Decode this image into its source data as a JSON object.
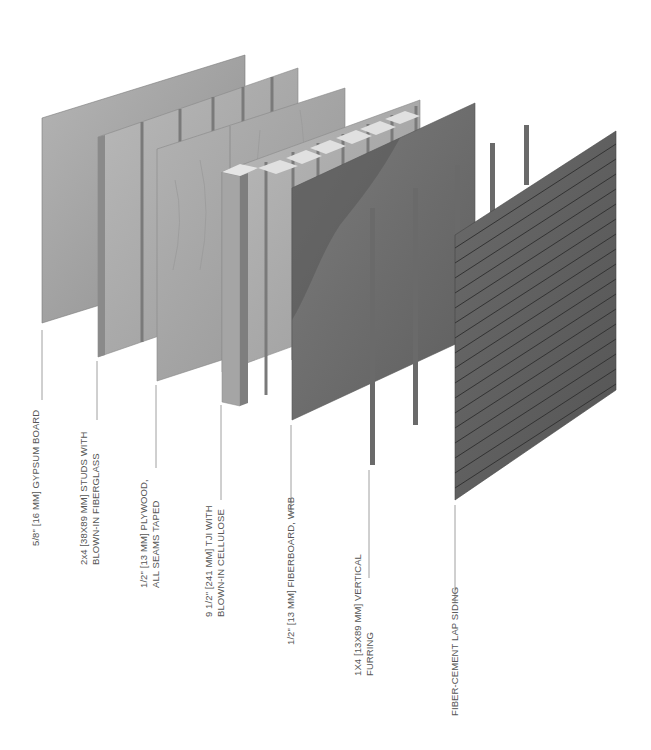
{
  "diagram": {
    "type": "exploded wall assembly",
    "layers": [
      {
        "id": "gypsum",
        "label_lines": [
          "5/8\" [16 MM] GYPSUM BOARD"
        ],
        "color": "#9a9a9a"
      },
      {
        "id": "studs",
        "label_lines": [
          "2x4 [38X89 MM] STUDS WITH",
          "BLOWN-IN FIBERGLASS"
        ],
        "color": "#a8a8a8"
      },
      {
        "id": "plywood",
        "label_lines": [
          "1/2\" [13 MM] PLYWOOD,",
          "ALL SEAMS TAPED"
        ],
        "color": "#a3a3a3"
      },
      {
        "id": "tji",
        "label_lines": [
          "9 1/2\" [241 MM] TJI WITH",
          "BLOWN-IN CELLULOSE"
        ],
        "color": "#acacac"
      },
      {
        "id": "fiberboard",
        "label_lines": [
          "1/2\" [13 MM] FIBERBOARD, WRB"
        ],
        "color": "#6e6e6e"
      },
      {
        "id": "furring",
        "label_lines": [
          "1X4 [13X89 MM] VERTICAL",
          "FURRING"
        ],
        "color": "#6a6a6a"
      },
      {
        "id": "siding",
        "label_lines": [
          "FIBER-CEMENT LAP SIDING"
        ],
        "color": "#5f5f5f"
      }
    ]
  },
  "colors": {
    "background": "#ffffff",
    "label_text": "#555555",
    "leader_line": "#888888"
  }
}
